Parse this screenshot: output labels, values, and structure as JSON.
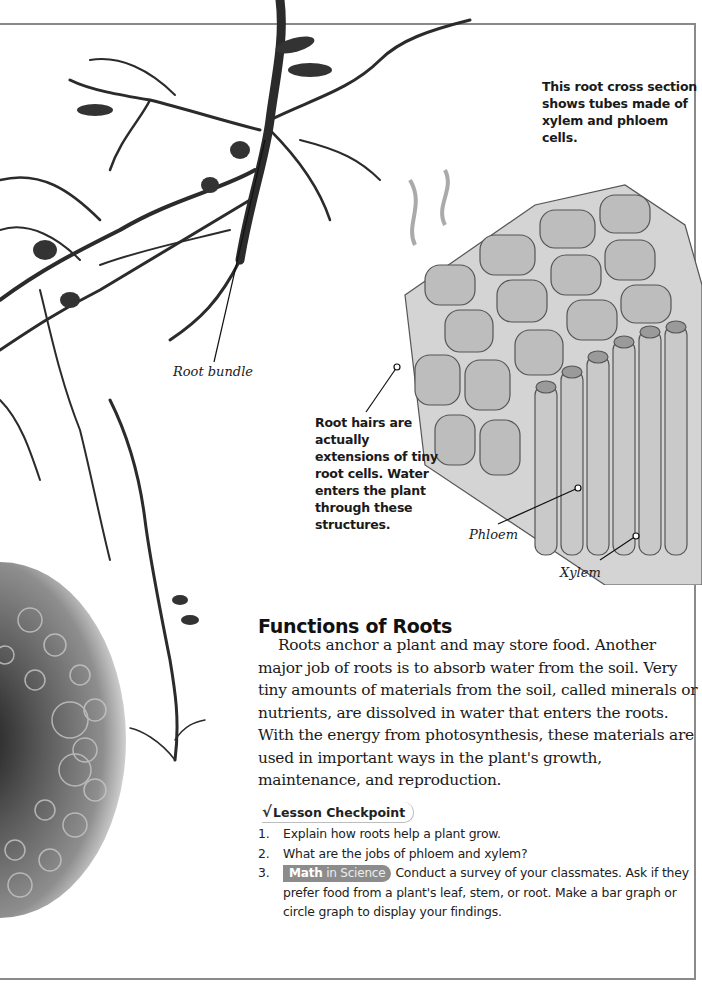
{
  "captions": {
    "cross_section": "This root cross section shows tubes made of xylem and phloem cells.",
    "root_hairs": "Root hairs are actually extensions of tiny root cells. Water enters the plant through these structures."
  },
  "labels": {
    "root_bundle": "Root bundle",
    "phloem": "Phloem",
    "xylem": "Xylem"
  },
  "section": {
    "title": "Functions of Roots",
    "paragraph": "Roots anchor a plant and may store food. Another major job of roots is to absorb water from the soil. Very tiny amounts of materials from the soil, called minerals or nutrients, are dissolved in water that enters the roots. With the energy from photosynthesis, these materials are used in important ways in the plant's growth, maintenance, and reproduction."
  },
  "checkpoint": {
    "icon": "checkmark-icon",
    "icon_glyph": "√",
    "label": "Lesson Checkpoint",
    "questions": [
      {
        "num": "1.",
        "text": "Explain how roots help a plant grow."
      },
      {
        "num": "2.",
        "text": "What are the jobs of phloem and xylem?"
      },
      {
        "num": "3.",
        "badge_bold": "Math",
        "badge_rest": " in Science",
        "text": "Conduct a survey of your classmates. Ask if they prefer food from a plant's leaf, stem, or root. Make a bar graph or circle graph to display your findings."
      }
    ]
  },
  "colors": {
    "frame": "#8a8a8a",
    "badge": "#8c8c8c",
    "text": "#1a1a1a"
  }
}
